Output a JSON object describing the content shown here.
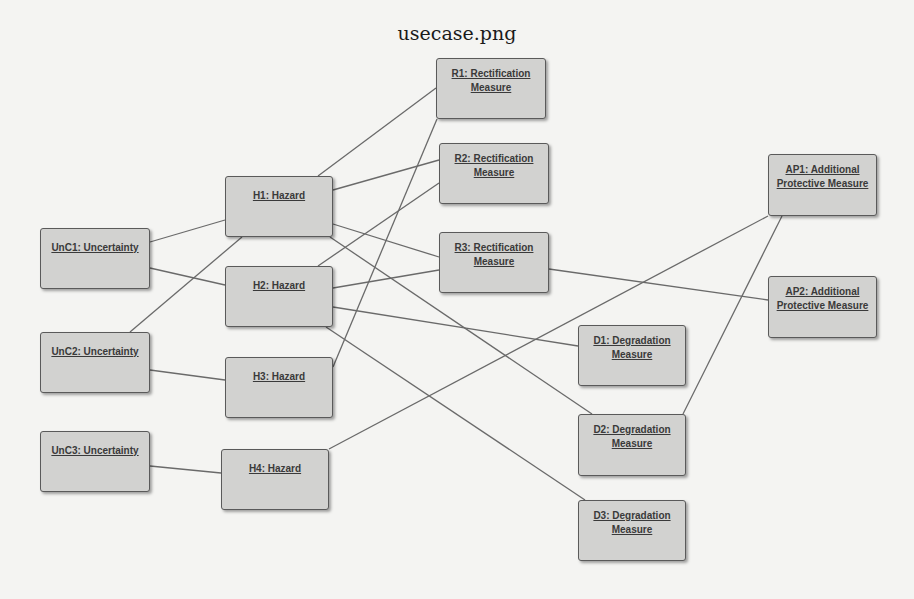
{
  "title": "usecase.png",
  "colors": {
    "background": "#f4f4f2",
    "node_fill": "#d2d2d0",
    "node_border": "#5a5a5a",
    "edge": "#6a6a6a",
    "text": "#3a3a3a"
  },
  "nodes": [
    {
      "id": "R1",
      "line1": "R1: Rectification",
      "line2": "Measure",
      "x": 436,
      "y": 58,
      "w": 110,
      "h": 61
    },
    {
      "id": "R2",
      "line1": "R2: Rectification",
      "line2": "Measure",
      "x": 439,
      "y": 143,
      "w": 110,
      "h": 61
    },
    {
      "id": "R3",
      "line1": "R3: Rectification",
      "line2": "Measure",
      "x": 439,
      "y": 232,
      "w": 110,
      "h": 61
    },
    {
      "id": "H1",
      "line1": "H1: Hazard",
      "line2": "",
      "x": 225,
      "y": 176,
      "w": 108,
      "h": 61
    },
    {
      "id": "H2",
      "line1": "H2: Hazard",
      "line2": "",
      "x": 225,
      "y": 266,
      "w": 108,
      "h": 61
    },
    {
      "id": "H3",
      "line1": "H3: Hazard",
      "line2": "",
      "x": 225,
      "y": 357,
      "w": 108,
      "h": 61
    },
    {
      "id": "H4",
      "line1": "H4: Hazard",
      "line2": "",
      "x": 221,
      "y": 449,
      "w": 108,
      "h": 61
    },
    {
      "id": "UnC1",
      "line1": "UnC1: Uncertainty",
      "line2": "",
      "x": 40,
      "y": 228,
      "w": 110,
      "h": 61
    },
    {
      "id": "UnC2",
      "line1": "UnC2: Uncertainty",
      "line2": "",
      "x": 40,
      "y": 332,
      "w": 110,
      "h": 61
    },
    {
      "id": "UnC3",
      "line1": "UnC3: Uncertainty",
      "line2": "",
      "x": 40,
      "y": 431,
      "w": 110,
      "h": 61
    },
    {
      "id": "D1",
      "line1": "D1: Degradation",
      "line2": "Measure",
      "x": 578,
      "y": 325,
      "w": 108,
      "h": 61
    },
    {
      "id": "D2",
      "line1": "D2: Degradation",
      "line2": "Measure",
      "x": 578,
      "y": 414,
      "w": 108,
      "h": 62
    },
    {
      "id": "D3",
      "line1": "D3: Degradation",
      "line2": "Measure",
      "x": 578,
      "y": 500,
      "w": 108,
      "h": 61
    },
    {
      "id": "AP1",
      "line1": "AP1: Additional",
      "line2": "Protective Measure",
      "x": 768,
      "y": 154,
      "w": 109,
      "h": 62
    },
    {
      "id": "AP2",
      "line1": "AP2: Additional",
      "line2": "Protective Measure",
      "x": 768,
      "y": 276,
      "w": 109,
      "h": 62
    }
  ],
  "edges": [
    {
      "from": "UnC1",
      "to": "H1",
      "x1": 150,
      "y1": 242,
      "x2": 225,
      "y2": 220
    },
    {
      "from": "UnC1",
      "to": "H2",
      "x1": 150,
      "y1": 268,
      "x2": 225,
      "y2": 285
    },
    {
      "from": "UnC2",
      "to": "H1",
      "x1": 130,
      "y1": 332,
      "x2": 242,
      "y2": 237
    },
    {
      "from": "UnC2",
      "to": "H3",
      "x1": 150,
      "y1": 370,
      "x2": 225,
      "y2": 380
    },
    {
      "from": "UnC3",
      "to": "H4",
      "x1": 150,
      "y1": 466,
      "x2": 221,
      "y2": 473
    },
    {
      "from": "H1",
      "to": "R1",
      "x1": 318,
      "y1": 176,
      "x2": 436,
      "y2": 88
    },
    {
      "from": "H1",
      "to": "R2",
      "x1": 333,
      "y1": 190,
      "x2": 439,
      "y2": 160
    },
    {
      "from": "H1",
      "to": "R3",
      "x1": 333,
      "y1": 224,
      "x2": 439,
      "y2": 257
    },
    {
      "from": "H1",
      "to": "D2",
      "x1": 330,
      "y1": 237,
      "x2": 592,
      "y2": 414
    },
    {
      "from": "H2",
      "to": "R2",
      "x1": 318,
      "y1": 266,
      "x2": 439,
      "y2": 183
    },
    {
      "from": "H2",
      "to": "R3",
      "x1": 333,
      "y1": 288,
      "x2": 439,
      "y2": 270
    },
    {
      "from": "H2",
      "to": "D1",
      "x1": 333,
      "y1": 307,
      "x2": 578,
      "y2": 346
    },
    {
      "from": "H2",
      "to": "D3",
      "x1": 326,
      "y1": 327,
      "x2": 585,
      "y2": 500
    },
    {
      "from": "H3",
      "to": "R1",
      "x1": 333,
      "y1": 367,
      "x2": 437,
      "y2": 119
    },
    {
      "from": "H4",
      "to": "AP1",
      "x1": 329,
      "y1": 449,
      "x2": 768,
      "y2": 216
    },
    {
      "from": "R3",
      "to": "AP2",
      "x1": 549,
      "y1": 269,
      "x2": 768,
      "y2": 300
    },
    {
      "from": "D2",
      "to": "AP1",
      "x1": 683,
      "y1": 414,
      "x2": 782,
      "y2": 216
    }
  ]
}
